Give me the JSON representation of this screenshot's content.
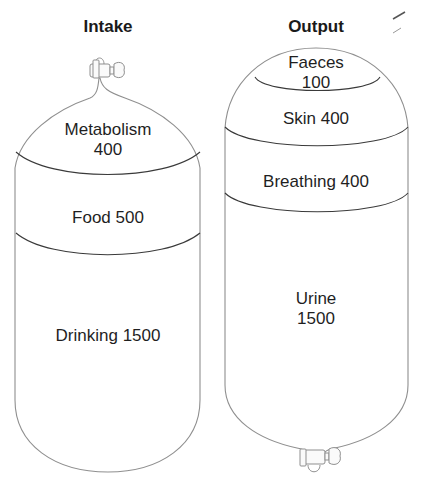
{
  "intake": {
    "title": "Intake",
    "segments": [
      {
        "name": "Metabolism",
        "value": 400,
        "label_line1": "Metabolism",
        "label_line2": "400"
      },
      {
        "name": "Food",
        "value": 500,
        "label": "Food 500"
      },
      {
        "name": "Drinking",
        "value": 1500,
        "label": "Drinking 1500"
      }
    ]
  },
  "output": {
    "title": "Output",
    "segments": [
      {
        "name": "Faeces",
        "value": 100,
        "label_line1": "Faeces",
        "label_line2": "100"
      },
      {
        "name": "Skin",
        "value": 400,
        "label": "Skin 400"
      },
      {
        "name": "Breathing",
        "value": 400,
        "label": "Breathing 400"
      },
      {
        "name": "Urine",
        "value": 1500,
        "label_line1": "Urine",
        "label_line2": "1500"
      }
    ]
  },
  "colors": {
    "outline": "#8a8a8a",
    "divider": "#3a3a3a",
    "text": "#1f1f1f"
  }
}
